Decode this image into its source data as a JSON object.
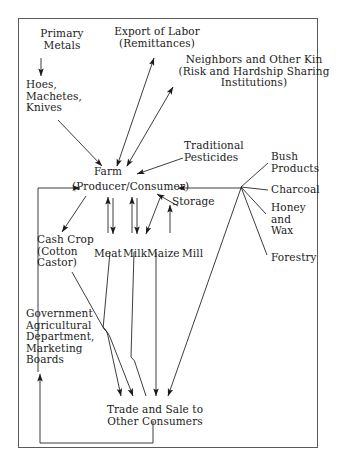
{
  "diagram": {
    "frame_color": "#5a5a5a",
    "line_color": "#1b1b1b",
    "text_color": "#1b1b1b",
    "background": "#ffffff",
    "nodes": [
      {
        "id": "primary_metals",
        "label": "Primary\nMetals"
      },
      {
        "id": "hoes",
        "label": "Hoes,\nMachetes,\nKnives"
      },
      {
        "id": "export_labor",
        "label": "Export of Labor\n(Remittances)"
      },
      {
        "id": "neighbors",
        "label": "Neighbors and Other Kin\n(Risk and Hardship Sharing\nInstitutions)"
      },
      {
        "id": "pesticides",
        "label": "Traditional\nPesticides"
      },
      {
        "id": "farm",
        "label": "Farm"
      },
      {
        "id": "farm_sub",
        "label": "(Producer/Consumer)"
      },
      {
        "id": "storage",
        "label": "Storage"
      },
      {
        "id": "bush_products",
        "label": "Bush\nProducts"
      },
      {
        "id": "charcoal",
        "label": "Charcoal"
      },
      {
        "id": "honey_wax",
        "label": "Honey\nand\nWax"
      },
      {
        "id": "forestry",
        "label": "Forestry"
      },
      {
        "id": "cash_crop",
        "label": "Cash Crop\n(Cotton\nCastor)"
      },
      {
        "id": "meat",
        "label": "Meat"
      },
      {
        "id": "milk",
        "label": "Milk"
      },
      {
        "id": "maize",
        "label": "Maize"
      },
      {
        "id": "mill",
        "label": "Mill"
      },
      {
        "id": "government",
        "label": "Government\nAgricultural\nDepartment,\nMarketing\nBoards"
      },
      {
        "id": "trade",
        "label": "Trade and Sale to\nOther Consumers"
      }
    ]
  }
}
